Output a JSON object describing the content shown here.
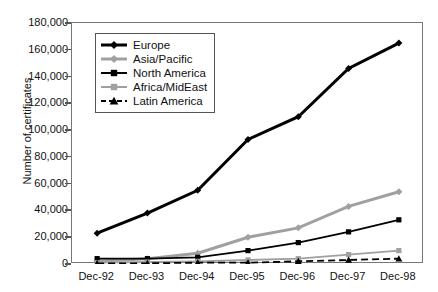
{
  "chart_data": {
    "type": "line",
    "title": "",
    "xlabel": "",
    "ylabel": "Number of certificates",
    "categories": [
      "Dec-92",
      "Dec-93",
      "Dec-94",
      "Dec-95",
      "Dec-96",
      "Dec-97",
      "Dec-98"
    ],
    "ylim": [
      0,
      180000
    ],
    "ytick_values": [
      0,
      20000,
      40000,
      60000,
      80000,
      100000,
      120000,
      140000,
      160000,
      180000
    ],
    "ytick_labels": [
      "0",
      "20,000",
      "40,000",
      "60,000",
      "80,000",
      "100,000",
      "120,000",
      "140,000",
      "160,000",
      "180,000"
    ],
    "grid": false,
    "legend_position": "upper-left-inside",
    "series": [
      {
        "name": "Europe",
        "values": [
          23000,
          38000,
          55000,
          93000,
          110000,
          146000,
          165000
        ],
        "color": "#000000",
        "marker": "diamond",
        "dash": "solid",
        "width": 3.0
      },
      {
        "name": "Asia/Pacific",
        "values": [
          2000,
          4000,
          8000,
          20000,
          27000,
          43000,
          54000
        ],
        "color": "#a0a0a0",
        "marker": "diamond",
        "dash": "solid",
        "width": 3.0
      },
      {
        "name": "North America",
        "values": [
          4000,
          4000,
          5000,
          10000,
          16000,
          24000,
          33000
        ],
        "color": "#000000",
        "marker": "square",
        "dash": "solid",
        "width": 1.8
      },
      {
        "name": "Africa/MidEast",
        "values": [
          1000,
          1500,
          2000,
          3000,
          4000,
          7000,
          10000
        ],
        "color": "#a0a0a0",
        "marker": "square",
        "dash": "solid",
        "width": 1.8
      },
      {
        "name": "Latin America",
        "values": [
          500,
          500,
          1000,
          1000,
          2000,
          3000,
          4000
        ],
        "color": "#000000",
        "marker": "triangle",
        "dash": "dashed",
        "width": 1.8
      }
    ]
  }
}
